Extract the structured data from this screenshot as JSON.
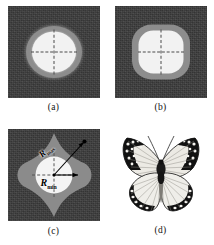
{
  "figure": {
    "panels": [
      {
        "key": "a",
        "caption": "(a)",
        "description": "circular beam spot with gray halo and white saturated core on dark noisy background",
        "shape": "circle"
      },
      {
        "key": "b",
        "caption": "(b)",
        "description": "superelliptical (rounded square) beam spot with gray halo and white core on dark noisy background",
        "shape": "superellipse"
      },
      {
        "key": "c",
        "caption": "(c)",
        "description": "four-lobed astroid star shaped gray region with white circular core, annotated with maximum and minimum radii",
        "shape": "astroid",
        "annotations": {
          "r_max": "R",
          "r_max_sub": "max",
          "r_min": "R",
          "r_min_sub": "min"
        }
      },
      {
        "key": "d",
        "caption": "(d)",
        "description": "photograph of a butterfly with black wing borders, white spots and radiating wing veins",
        "shape": "butterfly"
      }
    ],
    "colors": {
      "background_field": "#3b3b3b",
      "halo_gray": "#8d8d8d",
      "core_white": "#f2f2f2",
      "annotation_text": "#000000",
      "page_background": "#ffffff",
      "butterfly_dark": "#101010",
      "butterfly_light": "#f0f0ee"
    }
  }
}
